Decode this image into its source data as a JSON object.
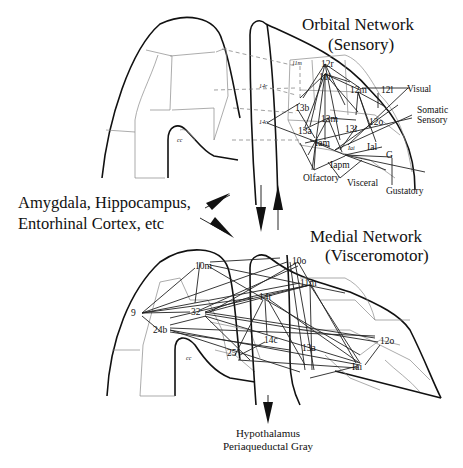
{
  "orbital_network": {
    "title_line1": "Orbital Network",
    "title_line2": "(Sensory)",
    "areas": [
      "12r",
      "11l",
      "12m",
      "12l",
      "13b",
      "13m",
      "13l",
      "12o",
      "13a",
      "Iam",
      "Ial",
      "Iai",
      "Iapm",
      "G",
      "11m",
      "14r",
      "14c"
    ],
    "inputs": [
      "Visual",
      "Somatic",
      "Sensory",
      "Olfactory",
      "Visceral",
      "Gustatory"
    ],
    "cc_label": "cc"
  },
  "medial_network": {
    "title_line1": "Medial Network",
    "title_line2": "(Visceromotor)",
    "areas": [
      "10m",
      "10o",
      "11m",
      "14r",
      "9",
      "32",
      "24b",
      "14c",
      "25",
      "13a",
      "12o",
      "Iai"
    ],
    "cc_label": "cc"
  },
  "side_labels": {
    "line1": "Amygdala, Hippocampus,",
    "line2": "Entorhinal Cortex, etc"
  },
  "bottom_labels": {
    "line1": "Hypothalamus",
    "line2": "Periaqueductal Gray"
  }
}
